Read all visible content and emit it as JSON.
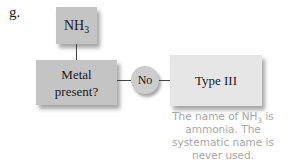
{
  "figure_label": "g.",
  "nodes": {
    "start": {
      "text": "NH",
      "sub": "3"
    },
    "decision": {
      "line1": "Metal",
      "line2": "present?"
    },
    "branch": {
      "label": "No"
    },
    "result": {
      "text": "Type III"
    }
  },
  "note": {
    "part1": "The name of NH",
    "sub": "3",
    "part2": " is ammonia. The systematic name is never used."
  },
  "colors": {
    "dark_box": "#c4c4c4",
    "light_box": "#e6e6e6",
    "note_text": "#a8a8a8"
  }
}
